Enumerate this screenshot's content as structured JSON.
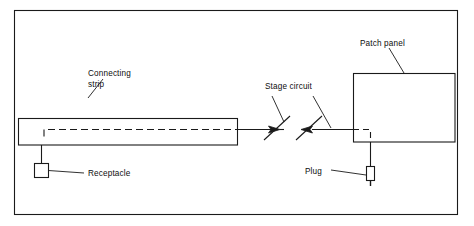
{
  "figure": {
    "type": "technical-line-diagram",
    "background_color": "#ffffff",
    "line_color": "#1a1a1a",
    "text_color": "#0d0d0d",
    "border": {
      "present": true,
      "x": 14,
      "y": 10,
      "width": 444,
      "height": 205
    }
  },
  "labels": {
    "connecting_strip_line1": "Connecting",
    "connecting_strip_line2": "strip",
    "receptacle": "Receptacle",
    "stage_circuit": "Stage circuit",
    "patch_panel": "Patch panel",
    "plug": "Plug"
  },
  "components": {
    "connecting_strip": {
      "name": "Connecting strip",
      "shape": "rectangle",
      "x": 18,
      "y": 118,
      "width": 219,
      "height": 27,
      "internal_conductor": "dashed"
    },
    "receptacle": {
      "name": "Receptacle",
      "shape": "small-square",
      "x": 34,
      "y": 163,
      "width": 15,
      "height": 15
    },
    "stage_circuit_switches": {
      "name": "Stage circuit",
      "count": 2,
      "symbol": "arrowhead-with-diagonal-stroke"
    },
    "patch_panel": {
      "name": "Patch panel",
      "shape": "rectangle",
      "x": 353,
      "y": 73,
      "width": 102,
      "height": 69,
      "internal_conductor": "dashed"
    },
    "plug": {
      "name": "Plug",
      "shape": "small-vertical-rectangle-with-prong",
      "x": 366,
      "y": 166,
      "width": 9,
      "height": 15
    }
  }
}
